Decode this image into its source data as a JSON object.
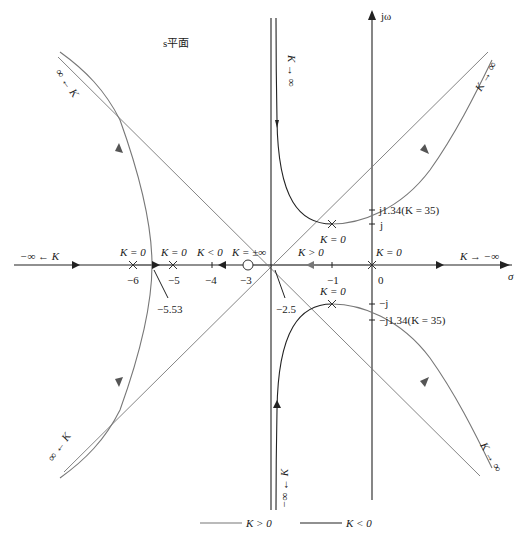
{
  "title": "s平面",
  "axes": {
    "imag_label": "jω",
    "real_label": "σ",
    "origin_px": [
      372,
      265
    ],
    "scale_px_per_unit": 40
  },
  "legend": {
    "positive": {
      "label": "K > 0",
      "color": "#777777"
    },
    "negative": {
      "label": "K < 0",
      "color": "#222222"
    }
  },
  "colors": {
    "k_positive": "#777777",
    "k_negative": "#222222",
    "axis": "#222222"
  },
  "real_ticks": [
    {
      "value": -6,
      "label": "−6"
    },
    {
      "value": -5,
      "label": "−5"
    },
    {
      "value": -4,
      "label": "−4"
    },
    {
      "value": -3,
      "label": "−3"
    },
    {
      "value": -1,
      "label": "−1"
    },
    {
      "value": 0,
      "label": "0"
    }
  ],
  "imag_ticks": [
    {
      "value": 1.34,
      "label": "j1.34(K = 35)"
    },
    {
      "value": 1,
      "label": "j"
    },
    {
      "value": -1,
      "label": "−j"
    },
    {
      "value": -1.34,
      "label": "−j1.34(K = 35)"
    }
  ],
  "poles": [
    {
      "s": "-6",
      "label": "K = 0"
    },
    {
      "s": "-5",
      "label": "K = 0"
    },
    {
      "s": "0",
      "label": "K = 0"
    },
    {
      "s": "-1+j",
      "label": "K = 0"
    },
    {
      "s": "-1-j",
      "label": "K = 0"
    }
  ],
  "zeros": [
    {
      "s": "-3",
      "label": "K = ±∞"
    }
  ],
  "annotations": {
    "breakaway": "−5.53",
    "centroid": "−2.5",
    "k_neg_left": "K < 0",
    "k_pos_mid": "K > 0",
    "k_to_neg_inf_right": "K → −∞",
    "neg_inf_left": "−∞ ← K",
    "k_to_inf_top": "K → ∞",
    "k_to_inf_upper_right": "K → ∞",
    "k_to_inf_lower_right": "K → ∞",
    "k_to_inf_upper_left": "∞ ← K",
    "k_to_inf_lower_left": "∞ ← K",
    "k_to_neg_inf_bottom": "−∞ ← K"
  }
}
